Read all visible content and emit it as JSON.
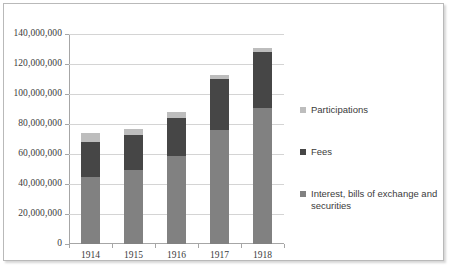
{
  "chart_data": {
    "type": "bar",
    "subtype": "stacked",
    "title": "",
    "xlabel": "",
    "ylabel": "",
    "categories": [
      "1914",
      "1915",
      "1916",
      "1917",
      "1918"
    ],
    "ylim": [
      0,
      140000000
    ],
    "ytick_step": 20000000,
    "ytick_labels": [
      "0",
      "20,000,000",
      "40,000,000",
      "60,000,000",
      "80,000,000",
      "100,000,000",
      "120,000,000",
      "140,000,000"
    ],
    "ytick_values": [
      0,
      20000000,
      40000000,
      60000000,
      80000000,
      100000000,
      120000000,
      140000000
    ],
    "grid": true,
    "legend_position": "right",
    "stack_order_bottom_to_top": [
      "Interest, bills of exchange and securities",
      "Fees",
      "Participations"
    ],
    "series": [
      {
        "name": "Interest, bills of exchange and securities",
        "color": "#818181",
        "values": [
          44700000,
          49500000,
          58500000,
          76000000,
          90500000
        ]
      },
      {
        "name": "Fees",
        "color": "#464646",
        "values": [
          23300000,
          23500000,
          25500000,
          34000000,
          37500000
        ]
      },
      {
        "name": "Participations",
        "color": "#bdbdbd",
        "values": [
          6000000,
          4000000,
          4000000,
          2500000,
          3000000
        ]
      }
    ],
    "totals": [
      74000000,
      77000000,
      88000000,
      112500000,
      131000000
    ]
  },
  "legend": {
    "items": [
      {
        "label": "Participations",
        "color": "#bdbdbd"
      },
      {
        "label": "Fees",
        "color": "#464646"
      },
      {
        "label": "Interest, bills of exchange and securities",
        "color": "#818181"
      }
    ]
  },
  "colors": {
    "gridline": "#d4d4d4",
    "axis": "#a6a6a6",
    "border": "#b9b9b9",
    "text": "#3b3b3b",
    "background": "#ffffff"
  }
}
